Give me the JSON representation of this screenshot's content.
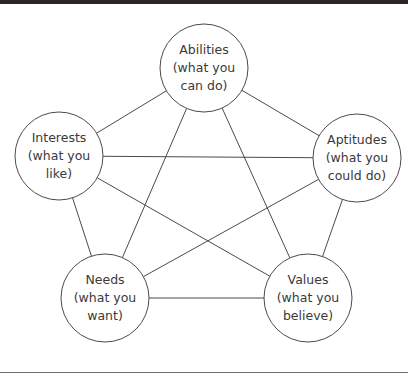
{
  "nodes": [
    {
      "id": "abilities",
      "title": "Abilities",
      "line2": "(what you",
      "line3": "can do)",
      "cx": 204,
      "cy": 68,
      "r": 44
    },
    {
      "id": "interests",
      "title": "Interests",
      "line2": "(what you",
      "line3": "like)",
      "cx": 59,
      "cy": 156,
      "r": 44
    },
    {
      "id": "aptitudes",
      "title": "Aptitudes",
      "line2": "(what you",
      "line3": "could do)",
      "cx": 357,
      "cy": 158,
      "r": 44
    },
    {
      "id": "needs",
      "title": "Needs",
      "line2": "(what you",
      "line3": "want)",
      "cx": 105,
      "cy": 298,
      "r": 44
    },
    {
      "id": "values",
      "title": "Values",
      "line2": "(what you",
      "line3": "believe)",
      "cx": 308,
      "cy": 298,
      "r": 44
    }
  ],
  "edges": [
    [
      "abilities",
      "interests"
    ],
    [
      "abilities",
      "aptitudes"
    ],
    [
      "abilities",
      "needs"
    ],
    [
      "abilities",
      "values"
    ],
    [
      "interests",
      "aptitudes"
    ],
    [
      "interests",
      "needs"
    ],
    [
      "interests",
      "values"
    ],
    [
      "aptitudes",
      "needs"
    ],
    [
      "aptitudes",
      "values"
    ],
    [
      "needs",
      "values"
    ]
  ],
  "colors": {
    "line": "#4a4a4a",
    "text": "#3a3a3a",
    "top_bar": "#2b2528"
  }
}
